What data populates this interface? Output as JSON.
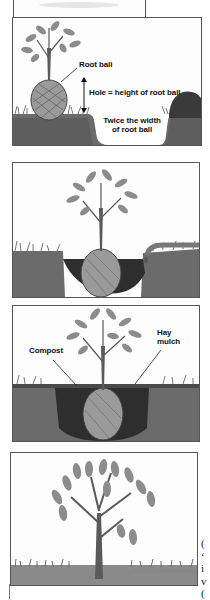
{
  "figure": {
    "panels": [
      {
        "step": 1,
        "labels": {
          "root_ball": "Root ball",
          "hole_depth": "Hole = height of root ball",
          "hole_width_line1": "Twice the width",
          "hole_width_line2": "of root ball"
        }
      },
      {
        "step": 2,
        "labels": {}
      },
      {
        "step": 3,
        "labels": {
          "compost": "Compost",
          "mulch_line1": "Hay",
          "mulch_line2": "mulch"
        }
      },
      {
        "step": 4,
        "labels": {}
      }
    ]
  },
  "side_text_fragments": [
    "(",
    "‘",
    "i",
    "v",
    "("
  ],
  "colors": {
    "border": "#555555",
    "soil_dark": "#3a3a3a",
    "soil_mid": "#6b6b6b",
    "grass": "#7a7a7a",
    "leaf": "#8c8c8c",
    "trunk": "#5a5a5a",
    "rootball": "#9a9a9a"
  }
}
